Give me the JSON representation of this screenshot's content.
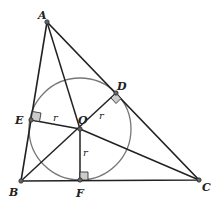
{
  "diagram": {
    "points": {
      "A": {
        "label": "A",
        "x": 47,
        "y": 22
      },
      "B": {
        "label": "B",
        "x": 21,
        "y": 181
      },
      "C": {
        "label": "C",
        "x": 199,
        "y": 180
      },
      "O": {
        "label": "O",
        "x": 80,
        "y": 129
      },
      "D": {
        "label": "D",
        "x": 116,
        "y": 93
      },
      "E": {
        "label": "E",
        "x": 31,
        "y": 120
      },
      "F": {
        "label": "F",
        "x": 80,
        "y": 180
      }
    },
    "radius_label": "r",
    "circle": {
      "center": "O",
      "radius": 51
    },
    "colors": {
      "line": "#222222",
      "circle": "#777777",
      "right_angle_fill": "#cccccc"
    }
  }
}
